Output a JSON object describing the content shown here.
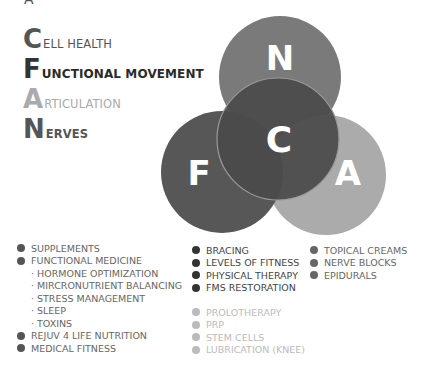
{
  "legend": {
    "top_clipped_glyph": "A",
    "rows": [
      {
        "initial": "C",
        "rest": "ELL HEALTH"
      },
      {
        "initial": "F",
        "rest": "UNCTIONAL MOVEMENT"
      },
      {
        "initial": "A",
        "rest": "RTICULATION"
      },
      {
        "initial": "N",
        "rest": "ERVES"
      }
    ]
  },
  "venn": {
    "circles": [
      {
        "letter": "N",
        "color": "#7a7a7a"
      },
      {
        "letter": "F",
        "color": "#575757"
      },
      {
        "letter": "A",
        "color": "#ababab"
      },
      {
        "letter": "C",
        "color": "#4a4a4a"
      }
    ]
  },
  "lists": {
    "cell_health": {
      "items": [
        "SUPPLEMENTS",
        "FUNCTIONAL MEDICINE"
      ],
      "sub_items": [
        "HORMONE OPTIMIZATION",
        "MIRCRONUTRIENT BALANCING",
        "STRESS MANAGEMENT",
        "SLEEP",
        "TOXINS"
      ],
      "items_after": [
        "REJUV 4 LIFE NUTRITION",
        "MEDICAL FITNESS"
      ]
    },
    "functional_movement": [
      "BRACING",
      "LEVELS OF FITNESS",
      "PHYSICAL THERAPY",
      "FMS RESTORATION"
    ],
    "articulation": [
      "PROLOTHERAPY",
      "PRP",
      "STEM CELLS",
      "LUBRICATION (KNEE)"
    ],
    "nerves": [
      "TOPICAL CREAMS",
      "NERVE BLOCKS",
      "EPIDURALS"
    ]
  }
}
